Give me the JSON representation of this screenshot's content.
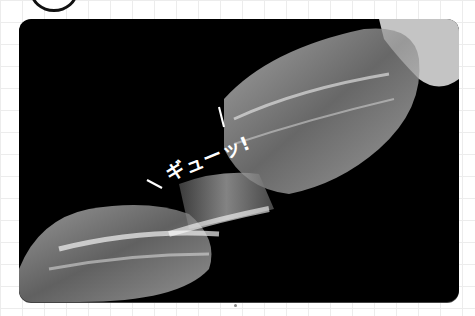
{
  "figure": {
    "caption": "ギューッ!",
    "colors": {
      "background": "#ffffff",
      "grid": "#ececec",
      "photo_bg": "#000000",
      "caption": "#ffffff"
    }
  }
}
